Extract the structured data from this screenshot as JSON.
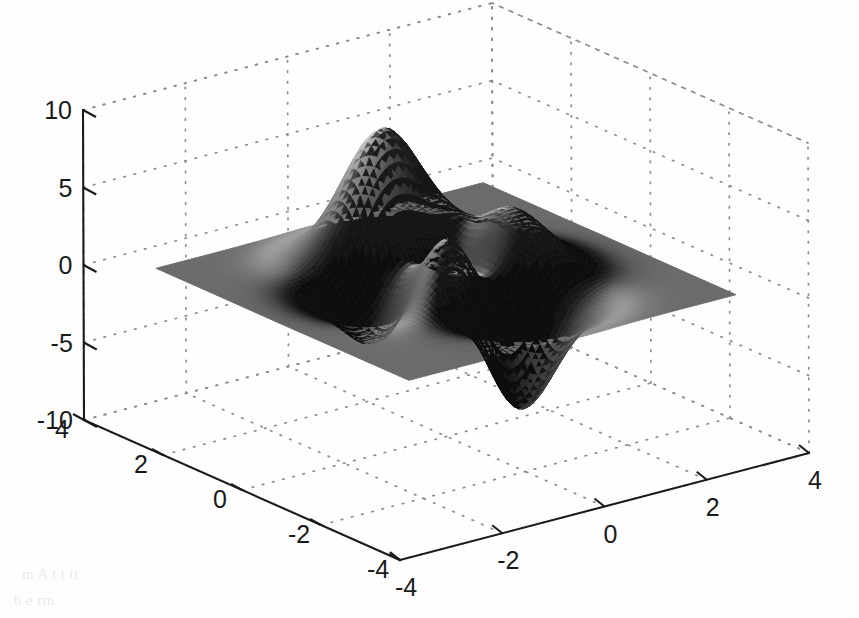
{
  "figure": {
    "width": 859,
    "height": 618,
    "background_color": "#fefefe",
    "render_style": "halftone-grayscale-scan"
  },
  "chart_data": {
    "type": "surface",
    "title": "",
    "subtitle": "",
    "xlabel": "",
    "ylabel": "",
    "zlabel": "",
    "grid": true,
    "legend": null,
    "colormap": "gray",
    "shading": "interp",
    "function": "peaks",
    "function_expression": "z = 3*(1-x)^2*exp(-x^2-(y+1)^2) - 10*(x/5 - x^3 - y^5)*exp(-x^2-y^2) - (1/3)*exp(-(x+1)^2 - y^2)",
    "x": {
      "label": "",
      "ticks": [
        -4,
        -2,
        0,
        2,
        4
      ],
      "tick_labels": [
        "-4",
        "-2",
        "0",
        "2",
        "4"
      ],
      "lim": [
        -4,
        4
      ],
      "axis_position": "bottom-right"
    },
    "y": {
      "label": "",
      "ticks": [
        4,
        2,
        0,
        -2,
        -4
      ],
      "tick_labels": [
        "4",
        "2",
        "0",
        "-2",
        "-4"
      ],
      "lim": [
        -4,
        4
      ],
      "axis_position": "bottom-left"
    },
    "z": {
      "label": "",
      "ticks": [
        10,
        5,
        0,
        -5,
        -10
      ],
      "tick_labels": [
        "10",
        "5",
        "0",
        "-5",
        "-10"
      ],
      "lim": [
        -10,
        10
      ],
      "axis_position": "left"
    },
    "view": {
      "azimuth": -37.5,
      "elevation": 30
    },
    "surface_domain": {
      "x_min": -3.2,
      "x_max": 3.2,
      "y_min": -3.2,
      "y_max": 3.2,
      "resolution": 76
    },
    "features": [
      {
        "name": "primary-peak",
        "x": -0.1,
        "y": 1.6,
        "z": 8.1
      },
      {
        "name": "secondary-peak",
        "x": -1.3,
        "y": -0.1,
        "z": 3.6
      },
      {
        "name": "central-ridge",
        "x": 0.35,
        "y": 0.2,
        "z": 3.0
      },
      {
        "name": "deep-valley",
        "x": 0.25,
        "y": -1.6,
        "z": -6.5
      },
      {
        "name": "shallow-dip",
        "x": -1.0,
        "y": -1.5,
        "z": -2.8
      },
      {
        "name": "base-plane",
        "x": 0,
        "y": 0,
        "z": 0
      }
    ]
  },
  "axes_geometry": {
    "origin_front": {
      "x": 400,
      "y": 560
    },
    "corner_left": {
      "x": 84,
      "y": 420
    },
    "corner_right": {
      "x": 809,
      "y": 453
    },
    "corner_back": {
      "x": 490,
      "y": 300
    },
    "z_top_left": {
      "x": 83,
      "y": 110
    },
    "z_top_back": {
      "x": 490,
      "y": 10
    },
    "z_top_right": {
      "x": 810,
      "y": 140
    },
    "z_axis_top_value": 10,
    "z_axis_bottom_value": -10
  },
  "scan_artifacts": {
    "bleed_lines": [
      "m A         t  t     tt  ",
      "   h     e    rm         "
    ]
  }
}
